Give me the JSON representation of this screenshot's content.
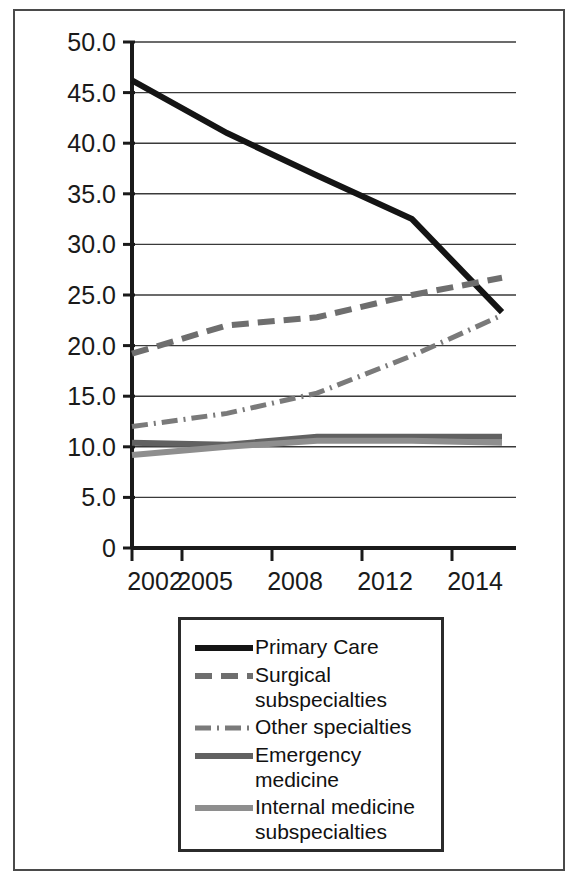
{
  "figure": {
    "background_color": "#ffffff",
    "frame_color": "#4a4a4a"
  },
  "chart_data": {
    "type": "line",
    "title": "",
    "subtitle": "",
    "xlabel": "",
    "ylabel": "",
    "x": [
      2002,
      2005,
      2008,
      2012,
      2014
    ],
    "categories": [
      "2002",
      "2005",
      "2008",
      "2012",
      "2014"
    ],
    "xtick_labels": [
      "2002",
      "2005",
      "2008",
      "2012",
      "2014"
    ],
    "ytick_labels": [
      "50.0",
      "45.0",
      "40.0",
      "35.0",
      "30.0",
      "25.0",
      "20.0",
      "15.0",
      "10.0",
      "5.0",
      "0"
    ],
    "ytick_values": [
      50.0,
      45.0,
      40.0,
      35.0,
      30.0,
      25.0,
      20.0,
      15.0,
      10.0,
      5.0,
      0
    ],
    "ylim": [
      0,
      50
    ],
    "xlim": [
      2002,
      2014
    ],
    "grid": "horizontal",
    "legend_position": "below-plot",
    "series": [
      {
        "name": "Primary Care",
        "values": [
          46.2,
          41.0,
          36.8,
          32.5,
          23.3
        ],
        "color": "#141414",
        "style": "solid",
        "width": 6,
        "dasharray": ""
      },
      {
        "name": "Surgical subspecialties",
        "label_lines": "Surgical\nsubspecialties",
        "values": [
          19.2,
          22.0,
          22.8,
          25.0,
          26.7
        ],
        "color": "#6e6e6e",
        "style": "dashed",
        "width": 6,
        "dasharray": "17,9"
      },
      {
        "name": "Other specialties",
        "label_lines": "Other specialties",
        "values": [
          12.0,
          13.3,
          15.3,
          19.0,
          23.0
        ],
        "color": "#7a7a7a",
        "style": "dash-dot",
        "width": 5,
        "dasharray": "16,6,2,6"
      },
      {
        "name": "Emergency medicine",
        "label_lines": "Emergency medicine",
        "values": [
          10.4,
          10.2,
          11.0,
          11.0,
          11.0
        ],
        "color": "#616161",
        "style": "solid",
        "width": 6,
        "dasharray": ""
      },
      {
        "name": "Internal medicine subspecialties",
        "label_lines": "Internal medicine\nsubspecialties",
        "values": [
          9.2,
          10.0,
          10.6,
          10.6,
          10.4
        ],
        "color": "#8e8e8e",
        "style": "solid",
        "width": 6,
        "dasharray": ""
      }
    ]
  },
  "legend": {
    "entries": [
      {
        "label": "Primary Care"
      },
      {
        "label": "Surgical\nsubspecialties"
      },
      {
        "label": "Other specialties"
      },
      {
        "label": "Emergency medicine"
      },
      {
        "label": "Internal medicine\nsubspecialties"
      }
    ]
  }
}
